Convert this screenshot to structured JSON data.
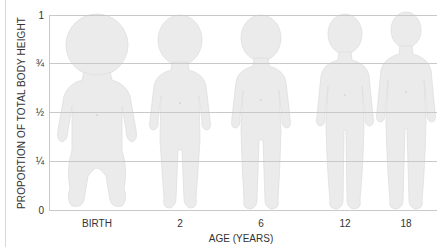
{
  "diagram": {
    "title": "",
    "y_axis": {
      "label": "PROPORTION OF TOTAL BODY HEIGHT",
      "ticks": [
        {
          "label": "1",
          "y": 15
        },
        {
          "label": "¾",
          "y": 63
        },
        {
          "label": "½",
          "y": 112
        },
        {
          "label": "¼",
          "y": 161
        },
        {
          "label": "0",
          "y": 210
        }
      ]
    },
    "x_axis": {
      "label": "AGE (YEARS)",
      "ticks": [
        {
          "label": "BIRTH",
          "x": 97
        },
        {
          "label": "2",
          "x": 180
        },
        {
          "label": "6",
          "x": 261
        },
        {
          "label": "12",
          "x": 345
        },
        {
          "label": "18",
          "x": 406
        }
      ]
    },
    "figures": [
      {
        "name": "birth",
        "caption": "BIRTH"
      },
      {
        "name": "age-2",
        "caption": "2"
      },
      {
        "name": "age-6",
        "caption": "6"
      },
      {
        "name": "age-12",
        "caption": "12"
      },
      {
        "name": "age-18",
        "caption": "18"
      }
    ],
    "colors": {
      "figure_fill": "#ebebeb",
      "figure_stroke": "#dcdcdc",
      "gridline": "#c9c9c9",
      "text": "#333333"
    }
  }
}
